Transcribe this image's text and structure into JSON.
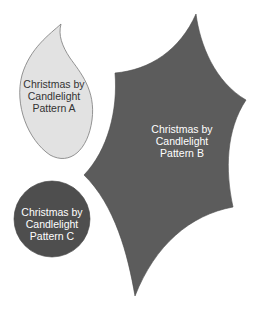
{
  "shapes": [
    {
      "id": "A",
      "shape": "flame-leaf",
      "fill": "#e2e2e2",
      "stroke": "#7a7a7a",
      "text_color": "#333333",
      "lines": [
        "Christmas by",
        "Candlelight",
        "Pattern A"
      ]
    },
    {
      "id": "B",
      "shape": "holly-leaf",
      "fill": "#5c5c5c",
      "stroke": "#4a4a4a",
      "text_color": "#ffffff",
      "lines": [
        "Christmas by",
        "Candlelight",
        "Pattern B"
      ]
    },
    {
      "id": "C",
      "shape": "circle",
      "fill": "#4e4e4e",
      "stroke": "#3a3a3a",
      "text_color": "#ffffff",
      "lines": [
        "Christmas by",
        "Candlelight",
        "Pattern C"
      ]
    }
  ]
}
